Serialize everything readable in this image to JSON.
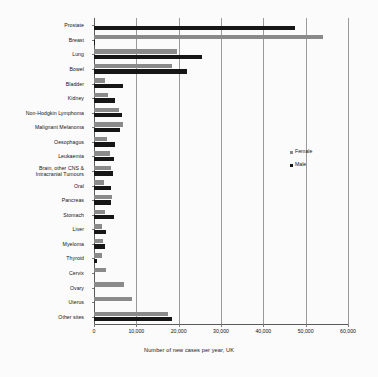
{
  "chart_data": {
    "type": "bar",
    "orientation": "horizontal",
    "title": "",
    "xlabel": "Number of new cases per year, UK",
    "ylabel": "",
    "xlim": [
      0,
      60000
    ],
    "xticks": [
      0,
      10000,
      20000,
      30000,
      40000,
      50000,
      60000
    ],
    "xtick_labels": [
      "0",
      "10,000",
      "20,000",
      "30,000",
      "40,000",
      "50,000",
      "60,000"
    ],
    "grid": true,
    "grid_axis": "x",
    "legend_position": "inside-right",
    "categories": [
      "Prostate",
      "Breast",
      "Lung",
      "Bowel",
      "Bladder",
      "Kidney",
      "Non-Hodgkin Lymphoma",
      "Malignant Melanoma",
      "Oesophagus",
      "Leukaemia",
      "Brain, other CNS &\nIntracranial Tumours",
      "Oral",
      "Pancreas",
      "Stomach",
      "Liver",
      "Myeloma",
      "Thyroid",
      "Cervix",
      "Ovary",
      "Uterus",
      "Other sites"
    ],
    "series": [
      {
        "name": "Female",
        "color": "#8a8a8a",
        "values": [
          0,
          54000,
          19500,
          18500,
          2600,
          3200,
          5800,
          6900,
          3100,
          3700,
          3900,
          2300,
          4200,
          2600,
          1800,
          2200,
          2000,
          2800,
          7000,
          9000,
          17500
        ]
      },
      {
        "name": "Male",
        "color": "#161616",
        "values": [
          47500,
          350,
          25500,
          22000,
          6800,
          4900,
          6500,
          6100,
          5000,
          4800,
          4600,
          4000,
          4100,
          4700,
          2900,
          2700,
          800,
          0,
          0,
          0,
          18400
        ]
      }
    ]
  },
  "legend": {
    "entries": [
      {
        "label": "Female",
        "swatch": "female"
      },
      {
        "label": "Male",
        "swatch": "male"
      }
    ]
  }
}
